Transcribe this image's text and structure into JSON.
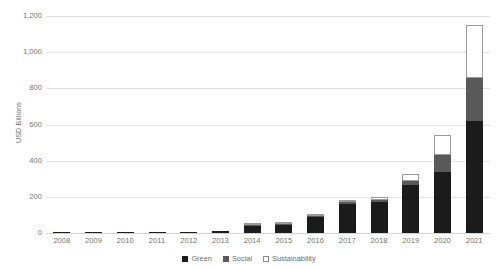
{
  "chart_data": {
    "type": "bar",
    "stacked": true,
    "title": "",
    "xlabel": "",
    "ylabel": "USD Billions",
    "ylim": [
      0,
      1200
    ],
    "yticks": [
      0,
      200,
      400,
      600,
      800,
      1000,
      1200
    ],
    "ytick_labels": [
      "0",
      "200",
      "400",
      "600",
      "800",
      "1,000",
      "1,200"
    ],
    "grid": true,
    "legend_position": "bottom-center",
    "categories": [
      "2008",
      "2009",
      "2010",
      "2011",
      "2012",
      "2013",
      "2014",
      "2015",
      "2016",
      "2017",
      "2018",
      "2019",
      "2020",
      "2021"
    ],
    "series": [
      {
        "name": "Green",
        "color": "#1b1b1b",
        "values": [
          1,
          1,
          4,
          2,
          3,
          11,
          37,
          46,
          87,
          162,
          171,
          267,
          337,
          620
        ]
      },
      {
        "name": "Social",
        "color": "#595959",
        "values": [
          0,
          0,
          0,
          0,
          0,
          0,
          1,
          2,
          3,
          9,
          14,
          19,
          93,
          235
        ]
      },
      {
        "name": "Sustainability",
        "color": "#ffffff",
        "border": "#9a9a9a",
        "values": [
          0,
          0,
          0,
          0,
          0,
          0,
          1,
          2,
          3,
          8,
          12,
          39,
          110,
          295
        ]
      }
    ],
    "totals": [
      1,
      1,
      4,
      2,
      3,
      11,
      39,
      50,
      93,
      179,
      197,
      325,
      540,
      1150
    ]
  },
  "axis": {
    "y_title": "USD Billions"
  },
  "legend": {
    "items": [
      {
        "label": "Green",
        "key": "green"
      },
      {
        "label": "Social",
        "key": "social"
      },
      {
        "label": "Sustainability",
        "key": "sustainability"
      }
    ]
  }
}
